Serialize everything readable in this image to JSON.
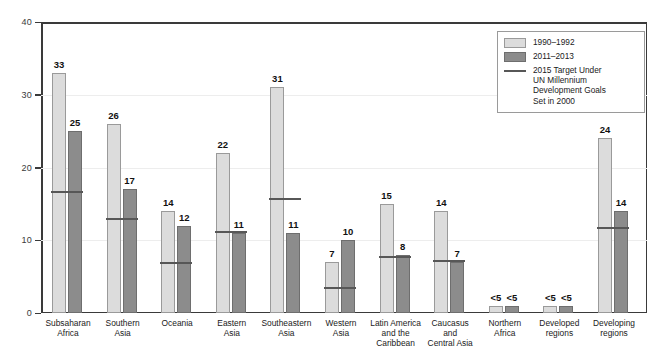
{
  "chart_data": {
    "type": "bar",
    "title": "",
    "xlabel": "",
    "ylabel": "",
    "ylim": [
      0,
      40
    ],
    "yticks": [
      0,
      10,
      20,
      30,
      40
    ],
    "grid": true,
    "legend_position": "top-right",
    "categories": [
      "Subsaharan Africa",
      "Southern Asia",
      "Oceania",
      "Eastern Asia",
      "Southeastern Asia",
      "Western Asia",
      "Latin America and the Caribbean",
      "Caucasus and Central Asia",
      "Northern Africa",
      "Developed regions",
      "Developing regions"
    ],
    "category_lines": [
      [
        "Subsaharan",
        "Africa"
      ],
      [
        "Southern",
        "Asia"
      ],
      [
        "Oceania"
      ],
      [
        "Eastern",
        "Asia"
      ],
      [
        "Southeastern",
        "Asia"
      ],
      [
        "Western",
        "Asia"
      ],
      [
        "Latin America",
        "and the",
        "Caribbean"
      ],
      [
        "Caucasus",
        "and",
        "Central Asia"
      ],
      [
        "Northern",
        "Africa"
      ],
      [
        "Developed",
        "regions"
      ],
      [
        "Developing",
        "regions"
      ]
    ],
    "series": [
      {
        "name": "1990–1992",
        "color": "#dcdcdc",
        "values": [
          33,
          26,
          14,
          22,
          31,
          7,
          15,
          14,
          1,
          1,
          24
        ],
        "labels": [
          "33",
          "26",
          "14",
          "22",
          "31",
          "7",
          "15",
          "14",
          "<5",
          "<5",
          "24"
        ]
      },
      {
        "name": "2011–2013",
        "color": "#8c8c8c",
        "values": [
          25,
          17,
          12,
          11,
          11,
          10,
          8,
          7,
          1,
          1,
          14
        ],
        "labels": [
          "25",
          "17",
          "12",
          "11",
          "11",
          "10",
          "8",
          "7",
          "<5",
          "<5",
          "14"
        ]
      }
    ],
    "target_series": {
      "name": "2015 Target Under UN Millennium Development Goals Set in 2000",
      "color": "#575757",
      "values": [
        16.5,
        12.8,
        6.7,
        11.0,
        15.5,
        3.3,
        7.5,
        7.0,
        null,
        null,
        11.5
      ]
    }
  },
  "legend": {
    "items": [
      {
        "swatch": "old",
        "label": "1990–1992"
      },
      {
        "swatch": "new",
        "label": "2011–2013"
      },
      {
        "swatch": "line",
        "label": "2015 Target Under\nUN Millennium Development Goals\nSet in 2000"
      }
    ],
    "target_line_1": "2015 Target Under",
    "target_line_2": "UN Millennium Development Goals",
    "target_line_3": "Set in 2000"
  },
  "axis": {
    "y_tick_labels": [
      "0",
      "10",
      "20",
      "30",
      "40"
    ]
  },
  "colors": {
    "series_old": "#dcdcdc",
    "series_new": "#8c8c8c",
    "target_line": "#575757",
    "axis": "#3a3a3a",
    "grid": "#ededed",
    "background": "#ffffff"
  }
}
